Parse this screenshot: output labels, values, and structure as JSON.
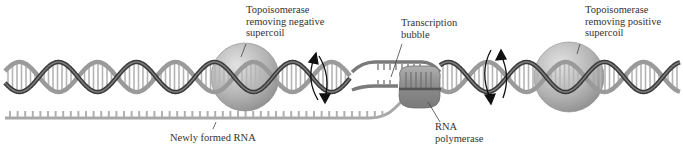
{
  "diagram": {
    "labels": {
      "topo_negative": {
        "lines": [
          "Topoisomerase",
          "removing negative",
          "supercoil"
        ]
      },
      "transcription_bubble": {
        "lines": [
          "Transcription",
          "bubble"
        ]
      },
      "topo_positive": {
        "lines": [
          "Topoisomerase",
          "removing positive",
          "supercoil"
        ]
      },
      "rna_polymerase": {
        "lines": [
          "RNA",
          "polymerase"
        ]
      },
      "newly_formed_rna": {
        "lines": [
          "Newly formed RNA"
        ]
      }
    },
    "colors": {
      "strand_dark": "#3a3a3a",
      "strand_light": "#9a9a9a",
      "rungs": "#b5b5b5",
      "sphere": "#b8b8b8",
      "polymerase": "#8e8e8e",
      "rna": "#a8a8a8",
      "arrow": "#111111",
      "leader": "#444444"
    },
    "elements": [
      {
        "name": "dna-double-helix",
        "description": "DNA double helix running left to right"
      },
      {
        "name": "topoisomerase-left",
        "description": "Sphere on helix, removes negative supercoil"
      },
      {
        "name": "rotation-arrows-left",
        "description": "Curved arrows indicating rotation"
      },
      {
        "name": "transcription-bubble",
        "description": "Unwound region of DNA"
      },
      {
        "name": "rna-polymerase",
        "description": "Enzyme within the bubble"
      },
      {
        "name": "rotation-arrows-right",
        "description": "Curved arrows indicating rotation"
      },
      {
        "name": "topoisomerase-right",
        "description": "Sphere on helix, removes positive supercoil"
      },
      {
        "name": "newly-formed-rna",
        "description": "RNA strand exiting the bubble"
      }
    ]
  }
}
